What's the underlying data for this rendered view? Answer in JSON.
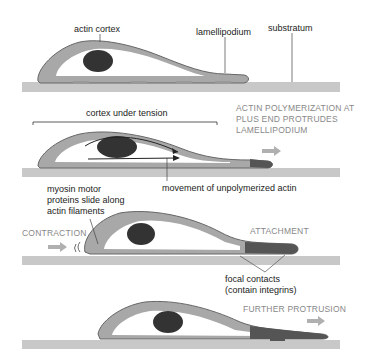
{
  "colors": {
    "substratum": "#c8c8c8",
    "cortex": "#a8a8a8",
    "cortex_outline": "#555555",
    "cytoplasm": "#ffffff",
    "nucleus": "#333333",
    "lamellipodium_polymerized": "#555555",
    "arrow": "#b0b0b0",
    "caption": "#888888"
  },
  "panels": [
    {
      "id": "stage-1",
      "labels": {
        "actin_cortex": "actin cortex",
        "lamellipodium": "lamellipodium",
        "substratum": "substratum"
      }
    },
    {
      "id": "stage-2",
      "labels": {
        "cortex_under_tension": "cortex under tension",
        "caption_line1": "ACTIN POLYMERIZATION AT",
        "caption_line2": "PLUS END PROTRUDES",
        "caption_line3": "LAMELLIPODIUM",
        "movement": "movement of unpolymerized actin"
      }
    },
    {
      "id": "stage-3",
      "labels": {
        "myosin_line1": "myosin motor",
        "myosin_line2": "proteins slide along",
        "myosin_line3": "actin filaments",
        "contraction": "CONTRACTION",
        "attachment": "ATTACHMENT",
        "focal_line1": "focal contacts",
        "focal_line2": "(contain integrins)"
      }
    },
    {
      "id": "stage-4",
      "labels": {
        "further_protrusion": "FURTHER PROTRUSION"
      }
    }
  ]
}
